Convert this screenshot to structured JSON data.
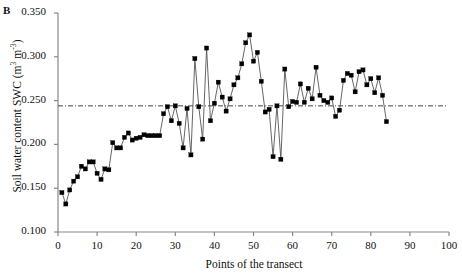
{
  "panel": {
    "label": "B"
  },
  "chart_data": {
    "type": "line",
    "title": "",
    "subtitle": "",
    "xlabel": "Points of the transect",
    "ylabel": "Soil water content SWC (m3 m-3)",
    "ylabel_parts": {
      "text": "Soil water content SWC (m",
      "sup1": "3",
      "mid": " m",
      "sup2": "-3",
      "close": ")"
    },
    "xlim": [
      0,
      100
    ],
    "ylim": [
      0.1,
      0.35
    ],
    "xticks": [
      0,
      10,
      20,
      30,
      40,
      50,
      60,
      70,
      80,
      90,
      100
    ],
    "yticks": [
      0.1,
      0.15,
      0.2,
      0.25,
      0.3,
      0.35
    ],
    "ytick_labels": [
      "0.100",
      "0.150",
      "0.200",
      "0.250",
      "0.300",
      "0.350"
    ],
    "xtick_labels": [
      "0",
      "10",
      "20",
      "30",
      "40",
      "50",
      "60",
      "70",
      "80",
      "90",
      "100"
    ],
    "grid": false,
    "legend": "none",
    "marker": "square-filled",
    "marker_color": "#000000",
    "line_color": "#555555",
    "reference_line": {
      "value": 0.244,
      "style": "dash-dot",
      "color": "#444444",
      "label": "mean SWC"
    },
    "x": [
      1,
      2,
      3,
      4,
      5,
      6,
      7,
      8,
      9,
      10,
      11,
      12,
      13,
      14,
      15,
      16,
      17,
      18,
      19,
      20,
      21,
      22,
      23,
      24,
      25,
      26,
      27,
      28,
      29,
      30,
      31,
      32,
      33,
      34,
      35,
      36,
      37,
      38,
      39,
      40,
      41,
      42,
      43,
      44,
      45,
      46,
      47,
      48,
      49,
      50,
      51,
      52,
      53,
      54,
      55,
      56,
      57,
      58,
      59,
      60,
      61,
      62,
      63,
      64,
      65,
      66,
      67,
      68,
      69,
      70,
      71,
      72,
      73,
      74,
      75,
      76,
      77,
      78,
      79,
      80,
      81,
      82,
      83,
      84
    ],
    "values": [
      0.145,
      0.132,
      0.148,
      0.158,
      0.163,
      0.175,
      0.172,
      0.18,
      0.18,
      0.167,
      0.16,
      0.172,
      0.171,
      0.202,
      0.196,
      0.196,
      0.208,
      0.213,
      0.205,
      0.207,
      0.208,
      0.211,
      0.21,
      0.21,
      0.21,
      0.21,
      0.235,
      0.243,
      0.227,
      0.244,
      0.224,
      0.196,
      0.241,
      0.188,
      0.298,
      0.243,
      0.206,
      0.31,
      0.227,
      0.247,
      0.271,
      0.254,
      0.238,
      0.252,
      0.268,
      0.276,
      0.292,
      0.316,
      0.325,
      0.295,
      0.305,
      0.272,
      0.237,
      0.24,
      0.186,
      0.244,
      0.183,
      0.286,
      0.243,
      0.249,
      0.248,
      0.269,
      0.248,
      0.264,
      0.252,
      0.288,
      0.256,
      0.25,
      0.248,
      0.253,
      0.232,
      0.239,
      0.273,
      0.281,
      0.279,
      0.26,
      0.283,
      0.285,
      0.268,
      0.275,
      0.259,
      0.276,
      0.256,
      0.226
    ]
  }
}
